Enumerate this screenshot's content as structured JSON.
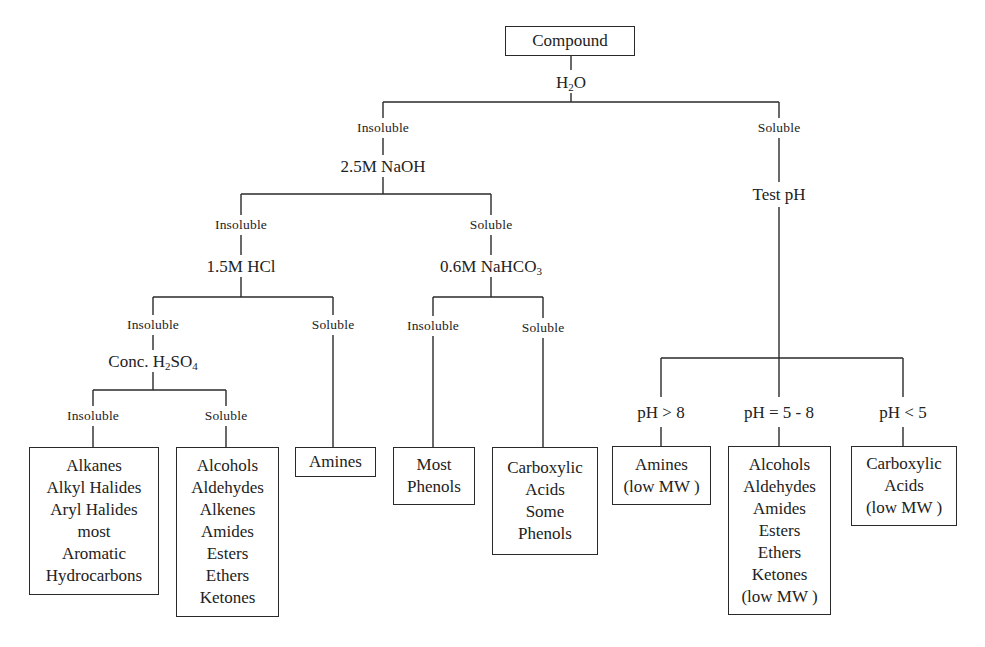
{
  "root": {
    "label": "Compound"
  },
  "reagents": {
    "water": {
      "pre": "H",
      "sub": "2",
      "post": "O"
    },
    "naoh": {
      "label": "2.5M NaOH"
    },
    "test_ph": {
      "label": "Test pH"
    },
    "hcl": {
      "label": "1.5M HCl"
    },
    "nahco3": {
      "pre": "0.6M NaHCO",
      "sub": "3",
      "post": ""
    },
    "h2so4": {
      "pre": "Conc. H",
      "sub": "2",
      "mid": "SO",
      "sub2": "4"
    }
  },
  "results": {
    "water_insoluble": "Insoluble",
    "water_soluble": "Soluble",
    "naoh_insoluble": "Insoluble",
    "naoh_soluble": "Soluble",
    "hcl_insoluble": "Insoluble",
    "hcl_soluble": "Soluble",
    "nahco3_insoluble": "Insoluble",
    "nahco3_soluble": "Soluble",
    "h2so4_insoluble": "Insoluble",
    "h2so4_soluble": "Soluble"
  },
  "ph_branches": {
    "high": "pH > 8",
    "mid": "pH = 5 - 8",
    "low": "pH < 5"
  },
  "boxes": {
    "h2so4_insoluble": [
      "Alkanes",
      "Alkyl Halides",
      "Aryl Halides",
      "most",
      "Aromatic",
      "Hydrocarbons"
    ],
    "h2so4_soluble": [
      "Alcohols",
      "Aldehydes",
      "Alkenes",
      "Amides",
      "Esters",
      "Ethers",
      "Ketones"
    ],
    "hcl_soluble": [
      "Amines"
    ],
    "nahco3_insoluble": [
      "Most",
      "Phenols"
    ],
    "nahco3_soluble": [
      "Carboxylic",
      "Acids",
      "Some",
      "Phenols"
    ],
    "ph_high": [
      "Amines",
      "(low MW )"
    ],
    "ph_mid": [
      "Alcohols",
      "Aldehydes",
      "Amides",
      "Esters",
      "Ethers",
      "Ketones",
      "(low MW )"
    ],
    "ph_low": [
      "Carboxylic",
      "Acids",
      "(low MW )"
    ]
  }
}
